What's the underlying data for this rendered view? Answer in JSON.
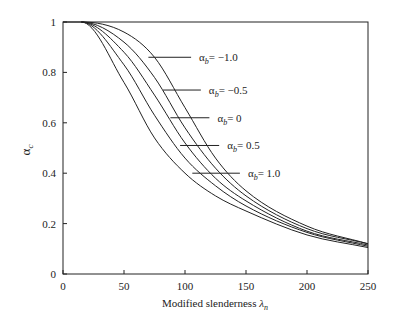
{
  "chart_data": {
    "type": "line",
    "title": "",
    "xlabel": "Modified slenderness λn",
    "ylabel": "αc",
    "xlim": [
      0,
      250
    ],
    "ylim": [
      0,
      1
    ],
    "xticks": [
      0,
      50,
      100,
      150,
      200,
      250
    ],
    "yticks": [
      0,
      0.2,
      0.4,
      0.6,
      0.8,
      1
    ],
    "grid": false,
    "x": [
      15,
      50,
      75,
      100,
      125,
      150,
      200,
      250
    ],
    "series": [
      {
        "name": "αb = −1.0",
        "label_y": 0.86,
        "label_x0": 70,
        "label_x1": 105,
        "values": [
          1,
          0.96,
          0.86,
          0.66,
          0.46,
          0.33,
          0.19,
          0.12
        ]
      },
      {
        "name": "αb = −0.5",
        "label_y": 0.73,
        "label_x0": 82,
        "label_x1": 113,
        "values": [
          1,
          0.92,
          0.78,
          0.58,
          0.42,
          0.31,
          0.18,
          0.12
        ]
      },
      {
        "name": "αb = 0",
        "label_y": 0.62,
        "label_x0": 88,
        "label_x1": 120,
        "values": [
          1,
          0.88,
          0.71,
          0.52,
          0.38,
          0.29,
          0.17,
          0.115
        ]
      },
      {
        "name": "αb = 0.5",
        "label_y": 0.51,
        "label_x0": 96,
        "label_x1": 128,
        "values": [
          1,
          0.83,
          0.63,
          0.46,
          0.35,
          0.27,
          0.165,
          0.11
        ]
      },
      {
        "name": "αb = 1.0",
        "label_y": 0.4,
        "label_x0": 106,
        "label_x1": 145,
        "values": [
          1,
          0.76,
          0.54,
          0.4,
          0.31,
          0.25,
          0.155,
          0.105
        ]
      }
    ],
    "legend_position": "inline-annotations"
  },
  "labels": {
    "xlabel_main": "Modified slenderness ",
    "xlabel_sym": "λ",
    "xlabel_sub": "n",
    "ylabel_sym": "α",
    "ylabel_sub": "c",
    "series_sym": "α",
    "series_sub": "b",
    "series_vals": [
      "= −1.0",
      "= −0.5",
      "= 0",
      "= 0.5",
      "= 1.0"
    ]
  }
}
